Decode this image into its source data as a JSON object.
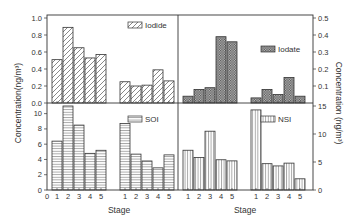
{
  "chart_data": [
    {
      "type": "bar",
      "panel": "top-left",
      "legend": "Iodide",
      "pattern": "diagonal-hatch",
      "groups": [
        {
          "categories": [
            "1",
            "2",
            "3",
            "4",
            "5"
          ],
          "values": [
            0.51,
            0.89,
            0.65,
            0.53,
            0.57
          ]
        },
        {
          "categories": [
            "1",
            "2",
            "3",
            "4",
            "5"
          ],
          "values": [
            0.25,
            0.2,
            0.21,
            0.39,
            0.26
          ]
        }
      ],
      "ylim": [
        0,
        1.0
      ],
      "yticks": [
        "0.0",
        "0.2",
        "0.4",
        "0.6",
        "0.8",
        "1.0"
      ],
      "axis": "left",
      "ylabel": "Concentration(ng/m³)"
    },
    {
      "type": "bar",
      "panel": "top-right",
      "legend": "Iodate",
      "pattern": "dense-crosshatch",
      "groups": [
        {
          "categories": [
            "1",
            "2",
            "3",
            "4",
            "5"
          ],
          "values": [
            0.04,
            0.08,
            0.09,
            0.39,
            0.36
          ]
        },
        {
          "categories": [
            "1",
            "2",
            "3",
            "4",
            "5"
          ],
          "values": [
            0.03,
            0.08,
            0.05,
            0.15,
            0.04
          ]
        }
      ],
      "ylim": [
        0,
        0.5
      ],
      "yticks": [
        "0.1",
        "0.2",
        "0.3",
        "0.4",
        "0.5"
      ],
      "axis": "right",
      "ylabel": "Concentration (ng/m³)"
    },
    {
      "type": "bar",
      "panel": "bottom-left",
      "legend": "SOI",
      "pattern": "horizontal-lines",
      "groups": [
        {
          "categories": [
            "1",
            "2",
            "3",
            "4",
            "5"
          ],
          "values": [
            6.4,
            11.0,
            8.5,
            4.8,
            5.2
          ]
        },
        {
          "categories": [
            "1",
            "2",
            "3",
            "4",
            "5"
          ],
          "values": [
            8.7,
            4.7,
            3.8,
            2.9,
            4.6
          ]
        }
      ],
      "ylim": [
        0,
        11
      ],
      "yticks": [
        "0",
        "2",
        "4",
        "6",
        "8",
        "10"
      ],
      "axis": "left",
      "xlabel": "Stage",
      "xticks": [
        "0",
        "1",
        "2",
        "3",
        "4",
        "5",
        "1",
        "2",
        "3",
        "4",
        "5"
      ]
    },
    {
      "type": "bar",
      "panel": "bottom-right",
      "legend": "NSI",
      "pattern": "vertical-lines",
      "groups": [
        {
          "categories": [
            "1",
            "2",
            "3",
            "4",
            "5"
          ],
          "values": [
            7.1,
            5.8,
            10.5,
            5.4,
            5.2
          ]
        },
        {
          "categories": [
            "1",
            "2",
            "3",
            "4",
            "5"
          ],
          "values": [
            14.3,
            4.7,
            4.3,
            4.8,
            2.0
          ]
        }
      ],
      "ylim": [
        0,
        15
      ],
      "yticks": [
        "0",
        "5",
        "10",
        "15"
      ],
      "axis": "right",
      "xlabel": "Stage",
      "xticks": [
        "1",
        "2",
        "3",
        "4",
        "5",
        "1",
        "2",
        "3",
        "4",
        "5"
      ]
    }
  ],
  "labels": {
    "left_ylabel": "Concentration(ng/m³)",
    "right_ylabel": "Concentration (ng/m³)",
    "xlabel_left": "Stage",
    "xlabel_right": "Stage",
    "legend_iodide": "Iodide",
    "legend_iodate": "Iodate",
    "legend_soi": "SOI",
    "legend_nsi": "NSI"
  }
}
